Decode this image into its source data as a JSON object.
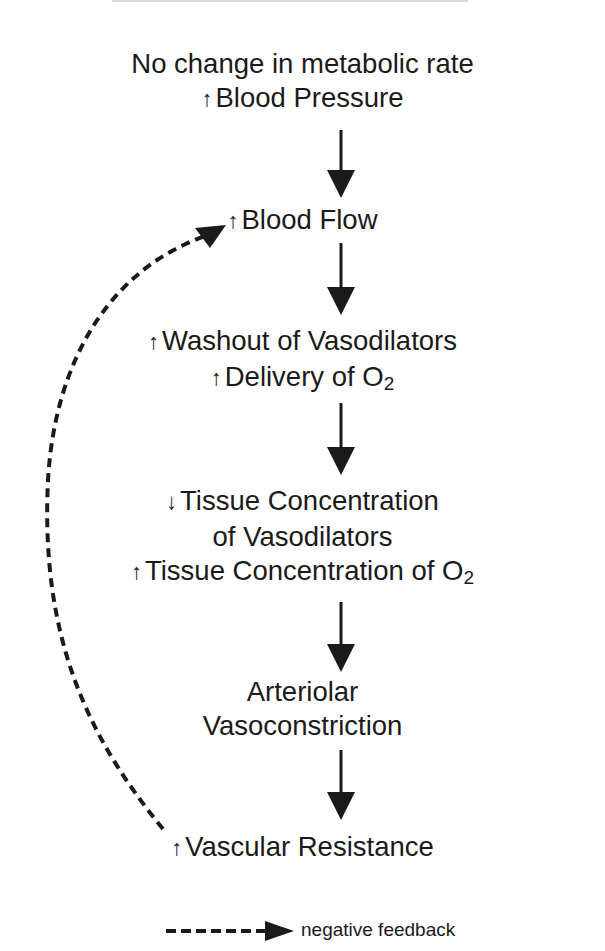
{
  "diagram": {
    "type": "flowchart",
    "colors": {
      "text": "#1a1a1a",
      "arrow": "#1a1a1a",
      "background": "#ffffff"
    },
    "nodes": [
      {
        "id": "metabolic",
        "lines": [
          {
            "prefix": "",
            "text": "No change in metabolic rate"
          },
          {
            "prefix": "↑",
            "text": "Blood Pressure"
          }
        ]
      },
      {
        "id": "flow",
        "lines": [
          {
            "prefix": "↑",
            "text": "Blood Flow"
          }
        ]
      },
      {
        "id": "washout",
        "lines": [
          {
            "prefix": "↑",
            "text": "Washout of Vasodilators"
          },
          {
            "prefix": "↑",
            "text": "Delivery of O",
            "sub": "2"
          }
        ]
      },
      {
        "id": "tissue",
        "lines": [
          {
            "prefix": "↓",
            "text": "Tissue Concentration"
          },
          {
            "prefix": "",
            "text": "of Vasodilators"
          },
          {
            "prefix": "↑",
            "text": "Tissue Concentration of O",
            "sub": "2"
          }
        ]
      },
      {
        "id": "arteriolar",
        "lines": [
          {
            "prefix": "",
            "text": "Arteriolar"
          },
          {
            "prefix": "",
            "text": "Vasoconstriction"
          }
        ]
      },
      {
        "id": "resistance",
        "lines": [
          {
            "prefix": "↑",
            "text": "Vascular Resistance"
          }
        ]
      }
    ],
    "edges": [
      {
        "from": "metabolic",
        "to": "flow",
        "style": "solid"
      },
      {
        "from": "flow",
        "to": "washout",
        "style": "solid"
      },
      {
        "from": "washout",
        "to": "tissue",
        "style": "solid"
      },
      {
        "from": "tissue",
        "to": "arteriolar",
        "style": "solid"
      },
      {
        "from": "arteriolar",
        "to": "resistance",
        "style": "solid"
      },
      {
        "from": "resistance",
        "to": "flow",
        "style": "dashed",
        "label": "negative feedback"
      }
    ],
    "legend": {
      "dashed_arrow_label": "negative feedback"
    }
  }
}
